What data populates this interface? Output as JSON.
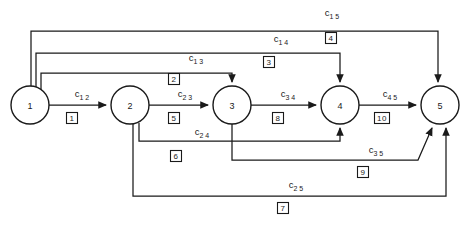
{
  "diagram": {
    "type": "directed-network-graph",
    "title": "",
    "background_color": "#ffffff",
    "line_color": "#1a1a1a",
    "width": 470,
    "height": 230,
    "nodes": [
      {
        "id": "1",
        "label": "1",
        "cx": 30,
        "cy": 105,
        "r": 19
      },
      {
        "id": "2",
        "label": "2",
        "cx": 130,
        "cy": 105,
        "r": 19
      },
      {
        "id": "3",
        "label": "3",
        "cx": 232,
        "cy": 105,
        "r": 19
      },
      {
        "id": "4",
        "label": "4",
        "cx": 340,
        "cy": 105,
        "r": 19
      },
      {
        "id": "5",
        "label": "5",
        "cx": 440,
        "cy": 105,
        "r": 19
      }
    ],
    "edges": [
      {
        "id": "e12",
        "from": "1",
        "to": "2",
        "cost_base": "c",
        "cost_sub": "1 2",
        "cost_x": 82,
        "cost_y": 97,
        "box_label": "1",
        "box_x": 72,
        "box_y": 118,
        "path": "M 49 105 L 106 105"
      },
      {
        "id": "e23",
        "from": "2",
        "to": "3",
        "cost_base": "c",
        "cost_sub": "2 3",
        "cost_x": 185,
        "cost_y": 97,
        "box_label": "5",
        "box_x": 174,
        "box_y": 118,
        "path": "M 149 105 L 208 105"
      },
      {
        "id": "e34",
        "from": "3",
        "to": "4",
        "cost_base": "c",
        "cost_sub": "3 4",
        "cost_x": 288,
        "cost_y": 97,
        "box_label": "8",
        "box_x": 278,
        "box_y": 118,
        "path": "M 251 105 L 316 105"
      },
      {
        "id": "e45",
        "from": "4",
        "to": "5",
        "cost_base": "c",
        "cost_sub": "4 5",
        "cost_x": 390,
        "cost_y": 97,
        "box_label": "10",
        "box_x": 382,
        "box_y": 118,
        "path": "M 359 105 L 416 105"
      },
      {
        "id": "e13",
        "from": "1",
        "to": "3",
        "cost_base": "c",
        "cost_sub": "1 3",
        "cost_x": 196,
        "cost_y": 61,
        "box_label": "2",
        "box_x": 174,
        "box_y": 79,
        "path": "M 41 95 L 41 73 L 232 73 L 232 82"
      },
      {
        "id": "e14",
        "from": "1",
        "to": "4",
        "cost_base": "c",
        "cost_sub": "1 4",
        "cost_x": 281,
        "cost_y": 42,
        "box_label": "3",
        "box_x": 269,
        "box_y": 62,
        "path": "M 36 94 L 36 53 L 340 53 L 340 82"
      },
      {
        "id": "e15",
        "from": "1",
        "to": "5",
        "cost_base": "c",
        "cost_sub": "1 5",
        "cost_x": 332,
        "cost_y": 16,
        "box_label": "4",
        "box_x": 331,
        "box_y": 38,
        "path": "M 31 92 L 31 31 L 438 31 L 438 82"
      },
      {
        "id": "e24",
        "from": "2",
        "to": "4",
        "cost_base": "c",
        "cost_sub": "2 4",
        "cost_x": 202,
        "cost_y": 135,
        "box_label": "6",
        "box_x": 176,
        "box_y": 156,
        "path": "M 139 123 L 139 141 L 340 141 L 340 128"
      },
      {
        "id": "e35",
        "from": "3",
        "to": "5",
        "cost_base": "c",
        "cost_sub": "3 5",
        "cost_x": 376,
        "cost_y": 153,
        "box_label": "9",
        "box_x": 363,
        "box_y": 172,
        "path": "M 232 124 L 232 160 L 418 160 L 432 128"
      },
      {
        "id": "e25",
        "from": "2",
        "to": "5",
        "cost_base": "c",
        "cost_sub": "2 5",
        "cost_x": 296,
        "cost_y": 188,
        "box_label": "7",
        "box_x": 283,
        "box_y": 208,
        "path": "M 133 124 L 133 196 L 446 196 L 446 128"
      }
    ]
  }
}
